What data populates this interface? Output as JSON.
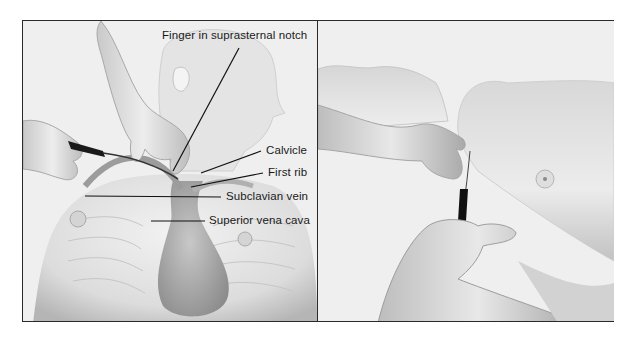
{
  "figure": {
    "panels": [
      {
        "id": "left",
        "description": "Anterior view of child with finger in suprasternal notch and needle inserted toward subclavian vein",
        "labels": [
          {
            "text": "Finger in suprasternal notch"
          },
          {
            "text": "Calvicle"
          },
          {
            "text": "First rib"
          },
          {
            "text": "Subclavian vein"
          },
          {
            "text": "Superior vena cava"
          }
        ]
      },
      {
        "id": "right",
        "description": "Lateral view of child with needle inserted beneath clavicle, operator hand guiding"
      }
    ],
    "colors": {
      "border": "#2a2a2a",
      "background": "#efefef",
      "skin_light": "#e6e6e6",
      "skin_shadow": "#9a9a9a",
      "label_line": "#111111"
    }
  }
}
